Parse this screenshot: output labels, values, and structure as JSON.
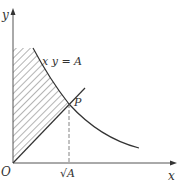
{
  "diagram": {
    "axes": {
      "x_label": "x",
      "y_label": "y",
      "origin_label": "O"
    },
    "curve_label": "x y = A",
    "point_label": "P",
    "tick_label_sqrtA": "√A",
    "colors": {
      "stroke": "#333333",
      "axis": "#555555",
      "hatch": "#444444",
      "background": "#ffffff"
    }
  }
}
